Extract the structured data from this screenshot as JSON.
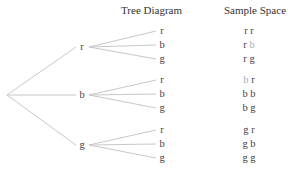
{
  "headers": {
    "tree": "Tree Diagram",
    "sample_space": "Sample Space"
  },
  "colors": {
    "line": "#c8c8c8",
    "text": "#444444",
    "highlight_faded": "#aaaaaa"
  },
  "root": {
    "x": 7,
    "y": 95
  },
  "level1": [
    {
      "label": "r",
      "x": 82,
      "y": 47
    },
    {
      "label": "b",
      "x": 82,
      "y": 95
    },
    {
      "label": "g",
      "x": 82,
      "y": 145
    }
  ],
  "level2": [
    {
      "parent": 0,
      "label": "r",
      "x": 162,
      "y": 31
    },
    {
      "parent": 0,
      "label": "b",
      "x": 162,
      "y": 45
    },
    {
      "parent": 0,
      "label": "g",
      "x": 162,
      "y": 59
    },
    {
      "parent": 1,
      "label": "r",
      "x": 162,
      "y": 80
    },
    {
      "parent": 1,
      "label": "b",
      "x": 162,
      "y": 94
    },
    {
      "parent": 1,
      "label": "g",
      "x": 162,
      "y": 108
    },
    {
      "parent": 2,
      "label": "r",
      "x": 162,
      "y": 130
    },
    {
      "parent": 2,
      "label": "b",
      "x": 162,
      "y": 144
    },
    {
      "parent": 2,
      "label": "g",
      "x": 162,
      "y": 158
    }
  ],
  "sample_space": [
    {
      "first": "r",
      "second": "r",
      "first_faded": false,
      "second_faded": false,
      "y": 31
    },
    {
      "first": "r",
      "second": "b",
      "first_faded": false,
      "second_faded": true,
      "y": 45
    },
    {
      "first": "r",
      "second": "g",
      "first_faded": false,
      "second_faded": false,
      "y": 59
    },
    {
      "first": "b",
      "second": "r",
      "first_faded": true,
      "second_faded": false,
      "y": 80
    },
    {
      "first": "b",
      "second": "b",
      "first_faded": false,
      "second_faded": false,
      "y": 94
    },
    {
      "first": "b",
      "second": "g",
      "first_faded": false,
      "second_faded": false,
      "y": 108
    },
    {
      "first": "g",
      "second": "r",
      "first_faded": false,
      "second_faded": false,
      "y": 130
    },
    {
      "first": "g",
      "second": "b",
      "first_faded": false,
      "second_faded": false,
      "y": 144
    },
    {
      "first": "g",
      "second": "g",
      "first_faded": false,
      "second_faded": false,
      "y": 158
    }
  ]
}
